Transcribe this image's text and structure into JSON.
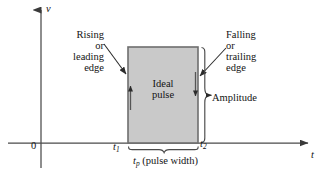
{
  "figure": {
    "background_color": "#ffffff",
    "axes": {
      "vertical_label": "v",
      "horizontal_label": "t",
      "origin_label": "0",
      "axis_color": "#4a4a4a"
    },
    "pulse": {
      "fill_color": "#c9c9c9",
      "edge_color": "#6e6e6e",
      "inner_label_line1": "Ideal",
      "inner_label_line2": "pulse"
    },
    "annotations": {
      "rising": {
        "line1": "Rising",
        "line2": "or",
        "line3": "leading",
        "line4": "edge"
      },
      "falling": {
        "line1": "Falling",
        "line2": "or",
        "line3": "trailing",
        "line4": "edge"
      },
      "amplitude_label": "Amplitude",
      "pulse_width_label": "(pulse width)",
      "pulse_width_symbol": "t",
      "pulse_width_subscript": "p",
      "time_start_symbol": "t",
      "time_start_subscript": "1",
      "time_end_symbol": "t",
      "time_end_subscript": "2"
    }
  }
}
